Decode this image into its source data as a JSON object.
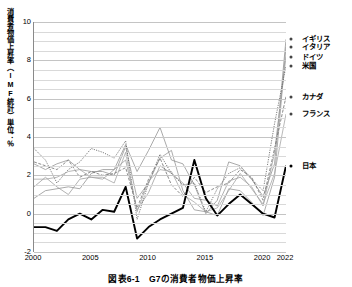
{
  "figure": {
    "caption": "図表6-1　G7の消費者物価上昇率",
    "y_axis_title": "消費者物価上昇率（IMF統計）単位：％"
  },
  "axis": {
    "y_ticks": [
      "10",
      "8",
      "6",
      "4",
      "2",
      "0",
      "-2"
    ],
    "x_ticks": [
      "2000",
      "2005",
      "2010",
      "2015",
      "2020",
      "2022"
    ]
  },
  "series_labels": {
    "uk": "イギリス",
    "italy": "イタリア",
    "germany": "ドイツ",
    "usa": "米国",
    "canada": "カナダ",
    "france": "フランス",
    "japan": "日本"
  },
  "chart_data": {
    "type": "line",
    "title": "図表6-1　G7の消費者物価上昇率",
    "xlabel": "",
    "ylabel": "消費者物価上昇率（IMF統計）単位：％",
    "xlim": [
      2000,
      2022
    ],
    "ylim": [
      -2,
      10
    ],
    "ytick_values": [
      10,
      8,
      6,
      4,
      2,
      0,
      -2
    ],
    "xtick_values": [
      2000,
      2005,
      2010,
      2015,
      2020,
      2022
    ],
    "gridline_step": 0.5,
    "grid": true,
    "legend_position": "right-end-labels",
    "x": [
      2000,
      2001,
      2002,
      2003,
      2004,
      2005,
      2006,
      2007,
      2008,
      2009,
      2010,
      2011,
      2012,
      2013,
      2014,
      2015,
      2016,
      2017,
      2018,
      2019,
      2020,
      2021,
      2022
    ],
    "series": [
      {
        "name": "イギリス",
        "color": "#8c8c8c",
        "style": "thin",
        "end_value": 9.1,
        "values": [
          0.8,
          1.2,
          1.3,
          1.4,
          1.3,
          2.1,
          2.3,
          2.3,
          3.6,
          2.2,
          3.3,
          4.5,
          2.8,
          2.6,
          1.5,
          0.0,
          0.7,
          2.7,
          2.5,
          1.8,
          0.9,
          2.6,
          9.1
        ]
      },
      {
        "name": "イタリア",
        "color": "#909090",
        "style": "thin",
        "end_value": 8.7,
        "values": [
          2.6,
          2.3,
          2.6,
          2.8,
          2.3,
          2.2,
          2.2,
          2.0,
          3.5,
          0.8,
          1.6,
          2.9,
          3.3,
          1.2,
          0.2,
          0.1,
          -0.1,
          1.3,
          1.2,
          0.6,
          -0.1,
          1.9,
          8.7
        ]
      },
      {
        "name": "ドイツ",
        "color": "#989898",
        "style": "thin",
        "end_value": 8.2,
        "values": [
          1.4,
          1.9,
          1.4,
          1.0,
          1.8,
          1.9,
          1.8,
          2.3,
          2.8,
          0.2,
          1.1,
          2.5,
          2.1,
          1.6,
          0.8,
          0.7,
          0.4,
          1.7,
          1.9,
          1.4,
          0.4,
          3.2,
          8.2
        ]
      },
      {
        "name": "米国",
        "color": "#5a5a5a",
        "style": "dotted",
        "end_value": 7.7,
        "values": [
          3.4,
          2.8,
          1.6,
          2.3,
          2.7,
          3.4,
          3.2,
          2.9,
          3.8,
          -0.3,
          1.6,
          3.1,
          2.1,
          1.5,
          1.6,
          0.1,
          1.3,
          2.1,
          2.4,
          1.8,
          1.2,
          4.7,
          7.7
        ]
      },
      {
        "name": "カナダ",
        "color": "#6e6e6e",
        "style": "dashed",
        "end_value": 6.1,
        "values": [
          2.7,
          2.5,
          2.3,
          2.8,
          1.9,
          2.2,
          2.0,
          2.1,
          2.4,
          0.3,
          1.8,
          2.9,
          1.5,
          0.9,
          1.9,
          1.1,
          1.4,
          1.6,
          2.3,
          1.9,
          0.7,
          3.4,
          6.1
        ]
      },
      {
        "name": "フランス",
        "color": "#a0a0a0",
        "style": "thin",
        "end_value": 5.2,
        "values": [
          1.8,
          1.8,
          1.9,
          2.2,
          2.3,
          1.9,
          1.9,
          1.6,
          3.2,
          0.1,
          1.7,
          2.3,
          2.2,
          1.0,
          0.6,
          0.1,
          0.3,
          1.2,
          2.1,
          1.3,
          0.5,
          2.1,
          5.2
        ]
      },
      {
        "name": "日本",
        "color": "#000000",
        "style": "bold",
        "end_value": 2.5,
        "values": [
          -0.7,
          -0.7,
          -0.9,
          -0.3,
          0.0,
          -0.3,
          0.2,
          0.1,
          1.4,
          -1.3,
          -0.7,
          -0.3,
          0.0,
          0.3,
          2.8,
          0.8,
          -0.1,
          0.5,
          1.0,
          0.5,
          0.0,
          -0.2,
          2.5
        ]
      }
    ]
  }
}
